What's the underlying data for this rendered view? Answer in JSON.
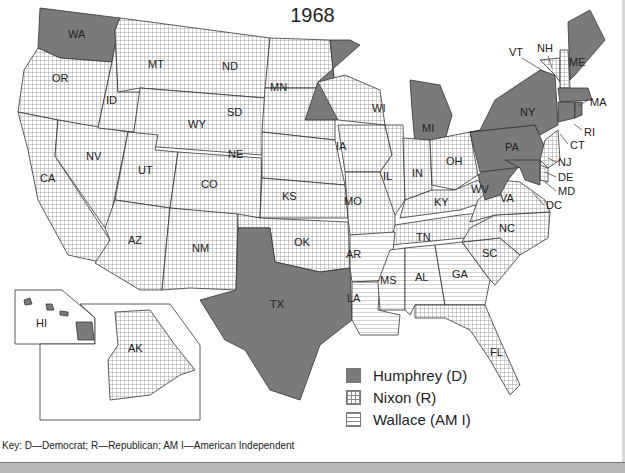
{
  "map": {
    "title": "1968",
    "colors": {
      "humphrey": "#7a7a7a",
      "nixon_grid": "#9a9a9a",
      "wallace_lines": "#9a9a9a",
      "border": "#333333"
    },
    "legend": [
      {
        "label": "Humphrey (D)",
        "pattern": "solid-gray"
      },
      {
        "label": "Nixon (R)",
        "pattern": "grid"
      },
      {
        "label": "Wallace (AM I)",
        "pattern": "horizontal-lines"
      }
    ],
    "key_text": "Key:  D—Democrat; R—Republican; AM I—American Independent",
    "states": {
      "humphrey": [
        "WA",
        "MN",
        "MI",
        "TX",
        "WV",
        "PA",
        "NY",
        "ME",
        "MA",
        "RI",
        "CT",
        "MD",
        "DC",
        "HI"
      ],
      "nixon": [
        "OR",
        "CA",
        "NV",
        "ID",
        "MT",
        "WY",
        "UT",
        "AZ",
        "CO",
        "NM",
        "ND",
        "SD",
        "NE",
        "KS",
        "OK",
        "IA",
        "MO",
        "WI",
        "IL",
        "IN",
        "OH",
        "KY",
        "TN",
        "VA",
        "NC",
        "SC",
        "FL",
        "NJ",
        "DE",
        "VT",
        "NH",
        "AK"
      ],
      "wallace": [
        "AR",
        "LA",
        "MS",
        "AL",
        "GA"
      ]
    },
    "labels": {
      "WA": "WA",
      "OR": "OR",
      "CA": "CA",
      "NV": "NV",
      "ID": "ID",
      "MT": "MT",
      "WY": "WY",
      "UT": "UT",
      "AZ": "AZ",
      "CO": "CO",
      "NM": "NM",
      "ND": "ND",
      "SD": "SD",
      "NE": "NE",
      "KS": "KS",
      "OK": "OK",
      "TX": "TX",
      "MN": "MN",
      "IA": "IA",
      "MO": "MO",
      "AR": "AR",
      "LA": "LA",
      "WI": "WI",
      "IL": "IL",
      "MI": "MI",
      "IN": "IN",
      "OH": "OH",
      "KY": "KY",
      "TN": "TN",
      "MS": "MS",
      "AL": "AL",
      "GA": "GA",
      "FL": "FL",
      "SC": "SC",
      "NC": "NC",
      "VA": "VA",
      "WV": "WV",
      "PA": "PA",
      "NY": "NY",
      "ME": "ME",
      "VT": "VT",
      "NH": "NH",
      "MA": "MA",
      "RI": "RI",
      "CT": "CT",
      "NJ": "NJ",
      "DE": "DE",
      "MD": "MD",
      "DC": "DC",
      "HI": "HI",
      "AK": "AK"
    }
  }
}
